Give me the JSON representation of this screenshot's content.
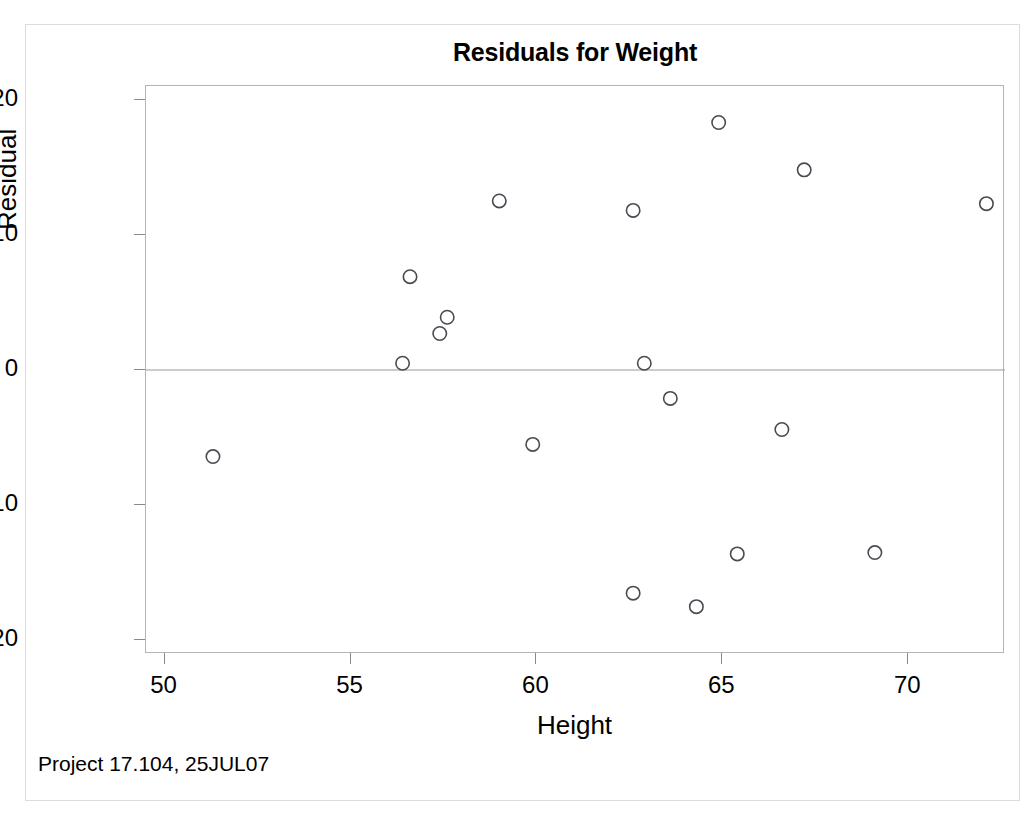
{
  "chart_data": {
    "type": "scatter",
    "title": "Residuals for Weight",
    "xlabel": "Height",
    "ylabel": "Residual",
    "xlim": [
      49.5,
      72.6
    ],
    "ylim": [
      -21.0,
      21.0
    ],
    "xticks": [
      50,
      55,
      60,
      65,
      70
    ],
    "yticks": [
      20,
      10,
      0,
      -10,
      -20
    ],
    "xtick_labels": [
      "50",
      "55",
      "60",
      "65",
      "70"
    ],
    "ytick_labels": [
      "20",
      "10",
      "0",
      "-10",
      "-20"
    ],
    "grid": false,
    "legend": null,
    "reference_line": {
      "axis": "y",
      "value": 0,
      "color": "#9a9a9a"
    },
    "marker": {
      "shape": "open-circle",
      "color": "#4a4a52",
      "size": 9
    },
    "points": [
      {
        "x": 51.3,
        "y": -6.4
      },
      {
        "x": 56.4,
        "y": 0.5
      },
      {
        "x": 56.6,
        "y": 6.9
      },
      {
        "x": 57.4,
        "y": 2.7
      },
      {
        "x": 57.6,
        "y": 3.9
      },
      {
        "x": 59.0,
        "y": 12.5
      },
      {
        "x": 59.9,
        "y": -5.5
      },
      {
        "x": 62.6,
        "y": 11.8
      },
      {
        "x": 62.9,
        "y": 0.5
      },
      {
        "x": 62.6,
        "y": -16.5
      },
      {
        "x": 63.6,
        "y": -2.1
      },
      {
        "x": 64.3,
        "y": -17.5
      },
      {
        "x": 64.9,
        "y": 18.3
      },
      {
        "x": 65.4,
        "y": -13.6
      },
      {
        "x": 66.6,
        "y": -4.4
      },
      {
        "x": 67.2,
        "y": 14.8
      },
      {
        "x": 69.1,
        "y": -13.5
      },
      {
        "x": 72.1,
        "y": 12.3
      }
    ],
    "annotations": [
      {
        "text": "Project 17.104, 25JUL07",
        "position": "bottom-left"
      }
    ]
  },
  "footer": {
    "note": "Project 17.104, 25JUL07"
  },
  "colors": {
    "marker_stroke": "#4a4a52",
    "axis": "#b4b4b4",
    "reference_line": "#9a9a9a",
    "text": "#000000",
    "page_border": "#dcdcdc"
  }
}
